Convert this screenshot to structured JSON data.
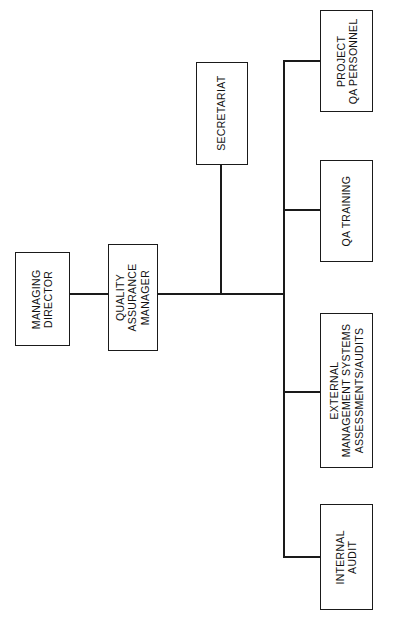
{
  "diagram": {
    "orientation": "rotated-90-counterclockwise",
    "line_color": "#1a1a1a",
    "box_fill": "#ffffff",
    "background": "#ffffff"
  },
  "nodes": {
    "managing_director": {
      "lines": [
        "MANAGING",
        "DIRECTOR"
      ]
    },
    "quality_assurance_manager": {
      "lines": [
        "QUALITY",
        "ASSURANCE",
        "MANAGER"
      ]
    },
    "secretariat": {
      "lines": [
        "SECRETARIAT"
      ]
    },
    "project_qa_personnel": {
      "lines": [
        "PROJECT",
        "QA PERSONNEL"
      ]
    },
    "qa_training": {
      "lines": [
        "QA TRAINING"
      ]
    },
    "external_management_systems": {
      "lines": [
        "EXTERNAL",
        "MANAGEMENT SYSTEMS",
        "ASSESSMENTS/AUDITS"
      ]
    },
    "internal_audit": {
      "lines": [
        "INTERNAL",
        "AUDIT"
      ]
    }
  },
  "connectors": [
    {
      "name": "md-to-qam",
      "type": "horizontal"
    },
    {
      "name": "qam-to-trunk",
      "type": "horizontal"
    },
    {
      "name": "secretariat-drop",
      "type": "vertical"
    },
    {
      "name": "trunk-vertical",
      "type": "vertical"
    },
    {
      "name": "branch-project-qa-personnel",
      "type": "horizontal"
    },
    {
      "name": "branch-qa-training",
      "type": "horizontal"
    },
    {
      "name": "branch-external-management-systems",
      "type": "horizontal"
    },
    {
      "name": "branch-internal-audit",
      "type": "horizontal"
    }
  ]
}
